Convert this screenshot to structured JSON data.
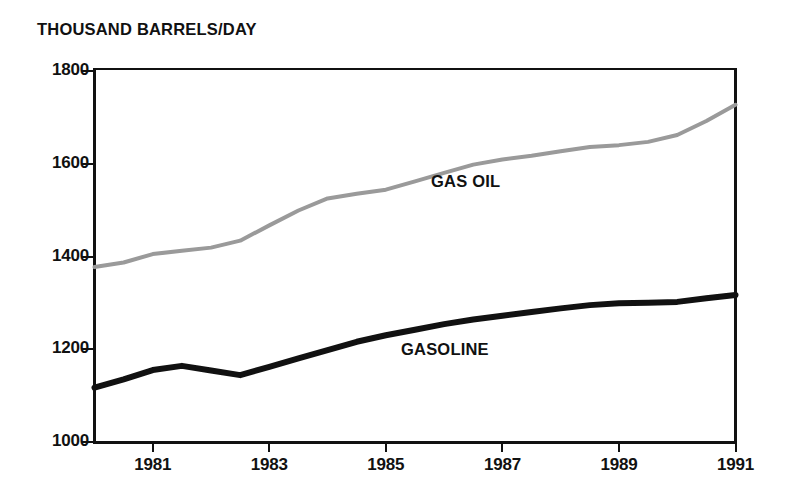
{
  "figure": {
    "y_axis_title": "THOUSAND BARRELS/DAY",
    "background_color": "#ffffff",
    "axis_color": "#111111"
  },
  "series_labels": {
    "gas_oil": "GAS OIL",
    "gasoline": "GASOLINE"
  },
  "axes": {
    "y_ticks": [
      {
        "label": "1800",
        "value": 1800
      },
      {
        "label": "1600",
        "value": 1600
      },
      {
        "label": "1400",
        "value": 1400
      },
      {
        "label": "1200",
        "value": 1200
      },
      {
        "label": "1000",
        "value": 1000
      }
    ],
    "x_ticks": [
      {
        "label": "1981",
        "value": 1981
      },
      {
        "label": "1983",
        "value": 1983
      },
      {
        "label": "1985",
        "value": 1985
      },
      {
        "label": "1987",
        "value": 1987
      },
      {
        "label": "1989",
        "value": 1989
      },
      {
        "label": "1991",
        "value": 1991
      }
    ]
  },
  "chart_data": {
    "type": "line",
    "title": "",
    "xlabel": "",
    "ylabel": "THOUSAND BARRELS/DAY",
    "xlim": [
      1980,
      1991
    ],
    "ylim": [
      1000,
      1800
    ],
    "xticks": [
      1981,
      1983,
      1985,
      1987,
      1989,
      1991
    ],
    "yticks": [
      1000,
      1200,
      1400,
      1600,
      1800
    ],
    "grid": false,
    "legend": "inline-labels",
    "x": [
      1980,
      1980.5,
      1981,
      1981.5,
      1982,
      1982.5,
      1983,
      1983.5,
      1984,
      1984.5,
      1985,
      1985.5,
      1986,
      1986.5,
      1987,
      1987.5,
      1988,
      1988.5,
      1989,
      1989.5,
      1990,
      1990.5,
      1991
    ],
    "series": [
      {
        "name": "GAS OIL",
        "color": "#9a9a9a",
        "line_width": 4,
        "values": [
          1375,
          1385,
          1403,
          1410,
          1417,
          1432,
          1465,
          1497,
          1523,
          1533,
          1542,
          1560,
          1578,
          1596,
          1607,
          1615,
          1625,
          1634,
          1638,
          1645,
          1660,
          1690,
          1725
        ]
      },
      {
        "name": "GASOLINE",
        "color": "#111111",
        "line_width": 6,
        "values": [
          1115,
          1133,
          1153,
          1162,
          1152,
          1142,
          1160,
          1178,
          1196,
          1214,
          1228,
          1240,
          1252,
          1262,
          1270,
          1278,
          1286,
          1293,
          1297,
          1298,
          1300,
          1308,
          1315
        ]
      }
    ]
  }
}
